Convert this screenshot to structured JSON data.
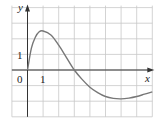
{
  "chart_data": {
    "type": "line",
    "title": "",
    "xlabel": "x",
    "ylabel": "y",
    "origin_label": "0",
    "x_tick_labels": [
      "1"
    ],
    "y_tick_labels": [
      "1"
    ],
    "xlim": [
      -1,
      8
    ],
    "ylim": [
      -3,
      4
    ],
    "grid": true,
    "series": [
      {
        "name": "f(x)",
        "x": [
          0,
          0.25,
          0.5,
          0.75,
          1,
          1.5,
          2,
          2.5,
          3,
          3.5,
          4,
          4.5,
          5,
          5.5,
          6,
          6.5,
          7,
          7.5,
          8
        ],
        "y": [
          0,
          1.4,
          2.1,
          2.45,
          2.5,
          2.25,
          1.6,
          0.8,
          0,
          -0.6,
          -1.1,
          -1.45,
          -1.7,
          -1.82,
          -1.85,
          -1.8,
          -1.7,
          -1.55,
          -1.4
        ]
      }
    ],
    "colors": {
      "curve": "#777777",
      "grid": "#c8c8c8",
      "axes": "#333333"
    }
  }
}
